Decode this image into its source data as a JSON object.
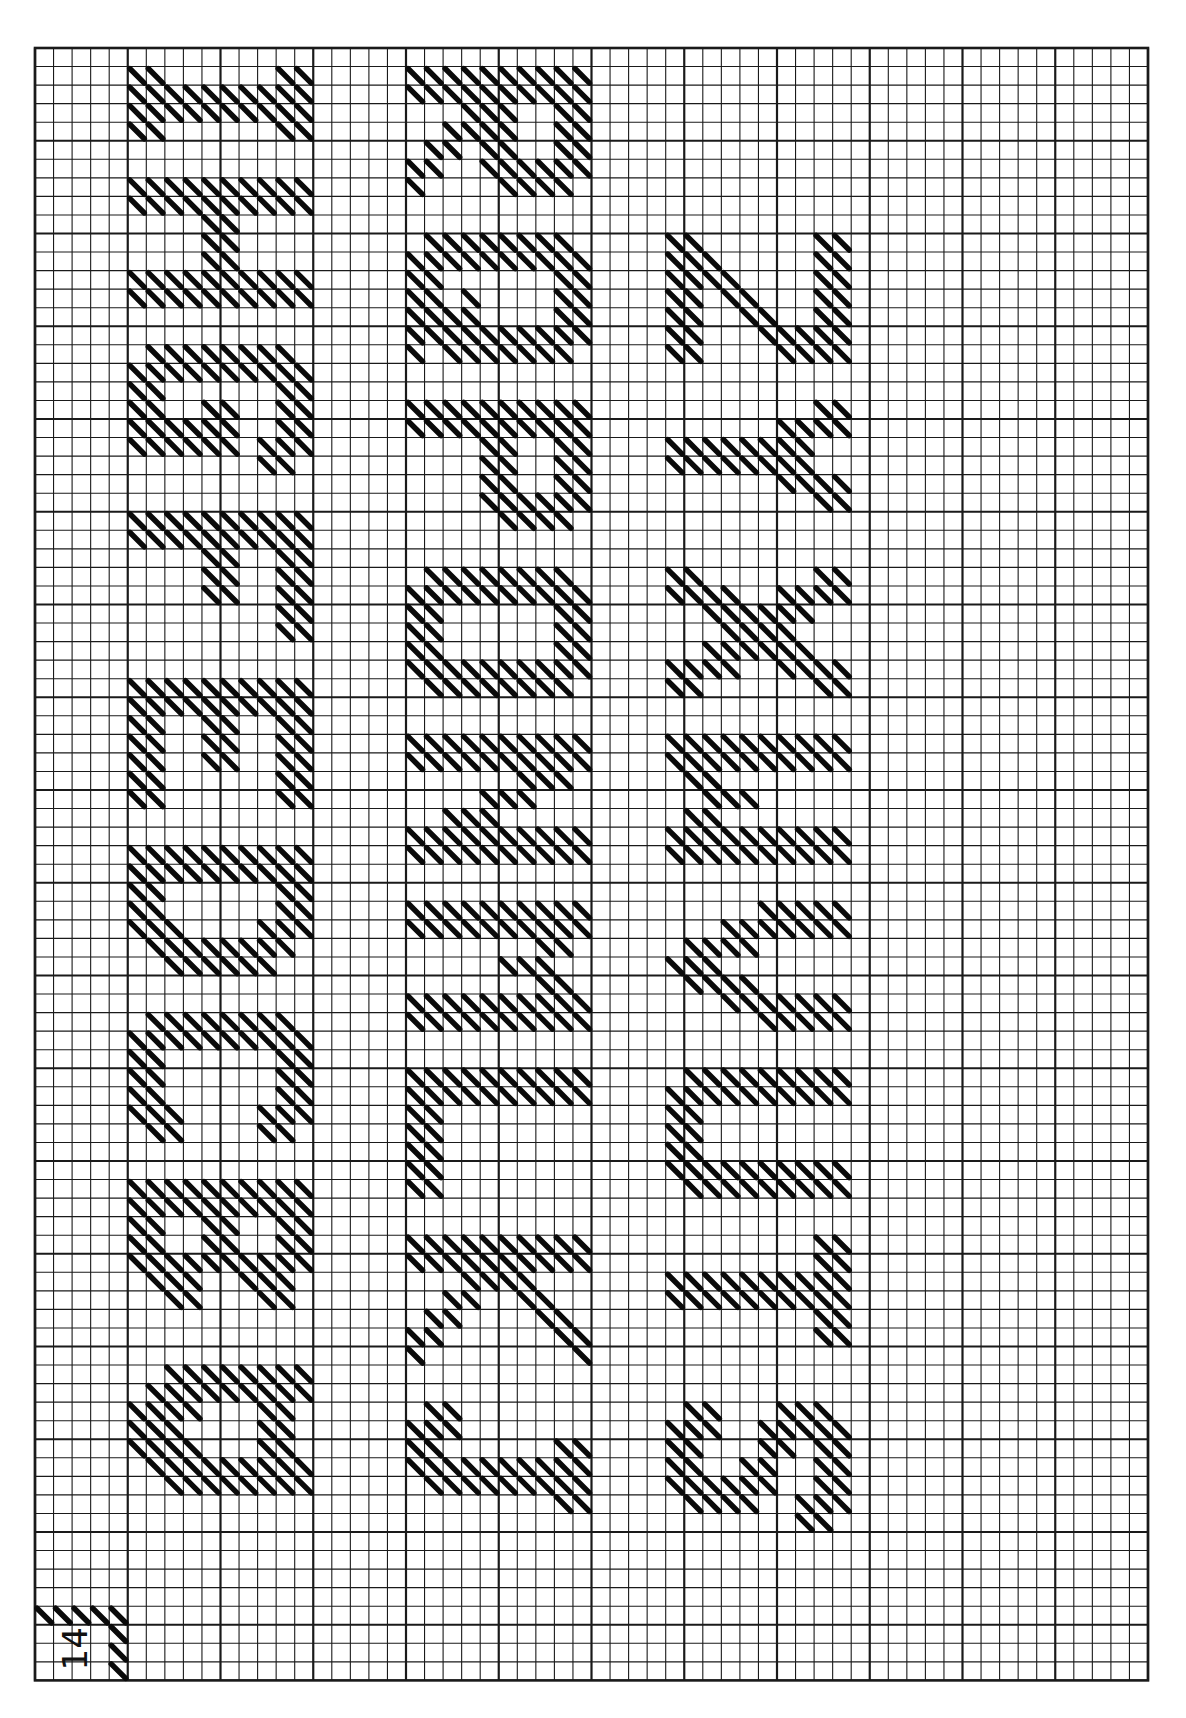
{
  "chart_meta": {
    "page_label": "14",
    "description": "Needlepoint alphabet chart (rotated 90°), tent-stitch diagonal marks on graph grid",
    "letters_columns": [
      [
        "A",
        "B",
        "C",
        "D",
        "E",
        "F",
        "G",
        "H",
        "I"
      ],
      [
        "J",
        "K",
        "L",
        "M",
        "N",
        "O",
        "P",
        "Q",
        "R"
      ],
      [
        "S",
        "T",
        "U",
        "V",
        "W",
        "X",
        "Y",
        "Z"
      ]
    ]
  },
  "grid": {
    "left": 35,
    "top": 48,
    "cell": 18.55,
    "cols": 60,
    "rows": 88,
    "major_every": 5,
    "line_color": "#1a1a1a",
    "stitch_color": "#0a0a0a"
  },
  "page_label_cells": {
    "col": 0,
    "row": 84
  },
  "letters": [
    {
      "ch": "A",
      "col": 5,
      "row": 71,
      "cells": [
        "0011111111",
        "0111111111",
        "1111000110",
        "1110000110",
        "1111000110",
        "0111111111",
        "0011111111"
      ]
    },
    {
      "ch": "B",
      "col": 5,
      "row": 61,
      "cells": [
        "1111111111",
        "1111111111",
        "1100110011",
        "1100110011",
        "1111111111",
        "0111001110",
        "0011000110"
      ]
    },
    {
      "ch": "C",
      "col": 5,
      "row": 52,
      "cells": [
        "0111111110",
        "1111111111",
        "1100000011",
        "1100000011",
        "1100000011",
        "1110000111",
        "0110000110"
      ]
    },
    {
      "ch": "D",
      "col": 5,
      "row": 43,
      "cells": [
        "1111111111",
        "1111111111",
        "1100000011",
        "1100000011",
        "1110000111",
        "0111111110",
        "0011111100"
      ]
    },
    {
      "ch": "E",
      "col": 5,
      "row": 34,
      "cells": [
        "1111111111",
        "1111111111",
        "1100110011",
        "1100110011",
        "1100110011",
        "1100000011",
        "1100000011"
      ]
    },
    {
      "ch": "F",
      "col": 5,
      "row": 25,
      "cells": [
        "1111111111",
        "1111111111",
        "0000110011",
        "0000110011",
        "0000110011",
        "0000000011",
        "0000000011"
      ]
    },
    {
      "ch": "G",
      "col": 5,
      "row": 16,
      "cells": [
        "0111111110",
        "1111111111",
        "1100000011",
        "1100110011",
        "1111110011",
        "1111110111",
        "0000000110"
      ]
    },
    {
      "ch": "H",
      "col": 5,
      "row": 7,
      "cells": [
        "1111111111",
        "1111111111",
        "0000110000",
        "0000110000",
        "0000110000",
        "1111111111",
        "1111111111"
      ]
    },
    {
      "ch": "I",
      "col": 5,
      "row": 1,
      "cells": [
        "1100000011",
        "1111111111",
        "1111111111",
        "1100000011"
      ]
    },
    {
      "ch": "J",
      "col": 20,
      "row": 73,
      "cells": [
        "0110000000",
        "1110000000",
        "1100000011",
        "1111111111",
        "0111111111",
        "0000000011"
      ]
    },
    {
      "ch": "K",
      "col": 20,
      "row": 64,
      "cells": [
        "1111111111",
        "1111111111",
        "0001111000",
        "0011001100",
        "0110000110",
        "1100000011",
        "1000000001"
      ]
    },
    {
      "ch": "L",
      "col": 20,
      "row": 55,
      "cells": [
        "1111111111",
        "1111111111",
        "1100000000",
        "1100000000",
        "1100000000",
        "1100000000",
        "1100000000"
      ]
    },
    {
      "ch": "M",
      "col": 20,
      "row": 46,
      "cells": [
        "1111111111",
        "1111111111",
        "0000000110",
        "0000011100",
        "0000000110",
        "1111111111",
        "1111111111"
      ]
    },
    {
      "ch": "N",
      "col": 20,
      "row": 37,
      "cells": [
        "1111111111",
        "1111111111",
        "0000001110",
        "0000111000",
        "0011100000",
        "1111111111",
        "1111111111"
      ]
    },
    {
      "ch": "O",
      "col": 20,
      "row": 28,
      "cells": [
        "0111111110",
        "1111111111",
        "1100000011",
        "1100000011",
        "1100000011",
        "1111111111",
        "0111111110"
      ]
    },
    {
      "ch": "P",
      "col": 20,
      "row": 19,
      "cells": [
        "1111111111",
        "1111111111",
        "0000110011",
        "0000110011",
        "0000110011",
        "0000111111",
        "0000011110"
      ]
    },
    {
      "ch": "Q",
      "col": 20,
      "row": 10,
      "cells": [
        "0111111110",
        "1111111111",
        "1100000011",
        "1101000011",
        "1111000011",
        "1111111111",
        "1011111110"
      ]
    },
    {
      "ch": "R",
      "col": 20,
      "row": 1,
      "cells": [
        "1111111111",
        "1111111111",
        "0001110011",
        "0011110011",
        "0110110011",
        "1100111111",
        "1000011110"
      ]
    },
    {
      "ch": "S",
      "col": 34,
      "row": 73,
      "cells": [
        "0110001110",
        "1110011111",
        "1100011011",
        "1100110011",
        "1111110011",
        "0111100111",
        "0000000110"
      ]
    },
    {
      "ch": "T",
      "col": 34,
      "row": 64,
      "cells": [
        "0000000011",
        "0000000011",
        "1111111111",
        "1111111111",
        "0000000011",
        "0000000011"
      ]
    },
    {
      "ch": "U",
      "col": 34,
      "row": 55,
      "cells": [
        "0111111111",
        "1111111111",
        "1100000000",
        "1100000000",
        "1100000000",
        "1111111111",
        "0111111111"
      ]
    },
    {
      "ch": "V",
      "col": 34,
      "row": 46,
      "cells": [
        "0000011111",
        "0001111111",
        "0111100000",
        "1110000000",
        "0111100000",
        "0001111111",
        "0000011111"
      ]
    },
    {
      "ch": "W",
      "col": 34,
      "row": 37,
      "cells": [
        "1111111111",
        "1111111111",
        "0110000000",
        "0011100000",
        "0110000000",
        "1111111111",
        "1111111111"
      ]
    },
    {
      "ch": "X",
      "col": 34,
      "row": 28,
      "cells": [
        "1100000011",
        "1111001111",
        "0011111100",
        "0001111000",
        "0011111100",
        "1111001111",
        "1100000011"
      ]
    },
    {
      "ch": "Y",
      "col": 34,
      "row": 19,
      "cells": [
        "0000000011",
        "0000001111",
        "1111111100",
        "1111111100",
        "0000001111",
        "0000000011"
      ]
    },
    {
      "ch": "Z",
      "col": 34,
      "row": 10,
      "cells": [
        "1100000011",
        "1110000011",
        "1111000011",
        "1101100011",
        "1100110011",
        "1100011111",
        "1100001111"
      ]
    }
  ]
}
